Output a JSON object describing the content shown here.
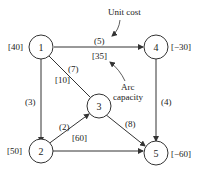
{
  "nodes": [
    {
      "id": "1",
      "label": "1",
      "supply": "[40]"
    },
    {
      "id": "2",
      "label": "2",
      "supply": "[50]"
    },
    {
      "id": "3",
      "label": "3",
      "supply": ""
    },
    {
      "id": "4",
      "label": "4",
      "supply": "[−30]"
    },
    {
      "id": "5",
      "label": "5",
      "supply": "[−60]"
    }
  ],
  "arcs": [
    {
      "from": "1",
      "to": "4",
      "cost": "(5)",
      "capacity": "[35]"
    },
    {
      "from": "1",
      "to": "3",
      "cost": "(7)",
      "capacity": "[10]"
    },
    {
      "from": "1",
      "to": "2",
      "cost": "(3)",
      "capacity": ""
    },
    {
      "from": "2",
      "to": "3",
      "cost": "(2)",
      "capacity": "[60]"
    },
    {
      "from": "2",
      "to": "5",
      "cost": "",
      "capacity": ""
    },
    {
      "from": "3",
      "to": "5",
      "cost": "(8)",
      "capacity": ""
    },
    {
      "from": "4",
      "to": "5",
      "cost": "(4)",
      "capacity": ""
    }
  ],
  "annotations": {
    "unit_cost": "Unit cost",
    "arc_capacity_line1": "Arc",
    "arc_capacity_line2": "capacity"
  }
}
